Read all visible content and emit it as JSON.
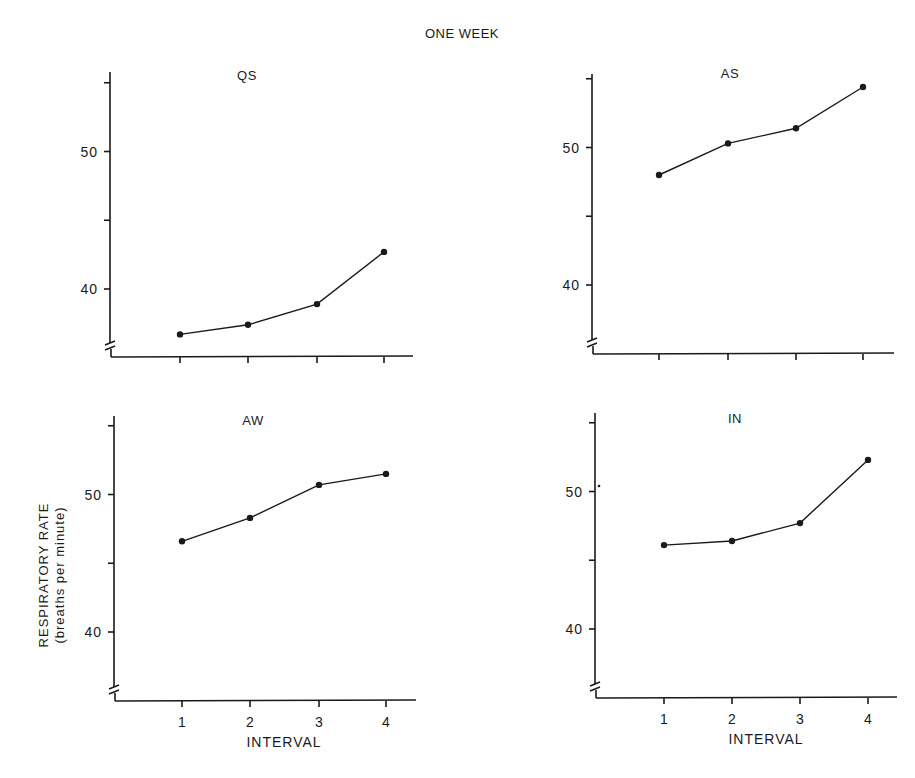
{
  "title": "ONE WEEK",
  "ylabel_line1": "RESPIRATORY RATE",
  "ylabel_line2": "(breaths per minute)",
  "xlabel": "INTERVAL",
  "chart_data": [
    {
      "type": "line",
      "title": "QS",
      "categories": [
        "1",
        "2",
        "3",
        "4"
      ],
      "values": [
        36.7,
        37.4,
        38.9,
        42.7
      ],
      "xlabel": "",
      "ylabel": "",
      "yticks": [
        40,
        50
      ],
      "ylim": [
        35,
        55
      ],
      "axis_break": true,
      "grid": false
    },
    {
      "type": "line",
      "title": "AS",
      "categories": [
        "1",
        "2",
        "3",
        "4"
      ],
      "values": [
        48.0,
        50.3,
        51.4,
        54.4
      ],
      "xlabel": "",
      "ylabel": "",
      "yticks": [
        40,
        50
      ],
      "ylim": [
        35,
        55
      ],
      "axis_break": true,
      "grid": false
    },
    {
      "type": "line",
      "title": "AW",
      "categories": [
        "1",
        "2",
        "3",
        "4"
      ],
      "values": [
        46.6,
        48.3,
        50.7,
        51.5
      ],
      "xlabel": "INTERVAL",
      "ylabel": "RESPIRATORY RATE (breaths per minute)",
      "yticks": [
        40,
        50
      ],
      "ylim": [
        35,
        55
      ],
      "axis_break": true,
      "grid": false
    },
    {
      "type": "line",
      "title": "IN",
      "categories": [
        "1",
        "2",
        "3",
        "4"
      ],
      "values": [
        46.1,
        46.4,
        47.7,
        52.3
      ],
      "xlabel": "INTERVAL",
      "ylabel": "",
      "yticks": [
        40,
        50
      ],
      "ylim": [
        35,
        55
      ],
      "axis_break": true,
      "grid": false
    }
  ]
}
